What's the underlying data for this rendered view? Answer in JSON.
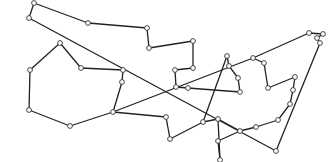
{
  "diagram": {
    "type": "graph-tour",
    "colors": {
      "edge": "#222222",
      "node_fill": "#ffffff",
      "node_stroke": "#333333",
      "background": "#ffffff"
    },
    "node_radius": 2.4,
    "nodes": [
      {
        "id": 0,
        "x": 34,
        "y": 3
      },
      {
        "id": 1,
        "x": 29,
        "y": 18
      },
      {
        "id": 2,
        "x": 88,
        "y": 23
      },
      {
        "id": 3,
        "x": 147,
        "y": 28
      },
      {
        "id": 4,
        "x": 149,
        "y": 48
      },
      {
        "id": 5,
        "x": 193,
        "y": 41
      },
      {
        "id": 6,
        "x": 193,
        "y": 68
      },
      {
        "id": 7,
        "x": 175,
        "y": 70
      },
      {
        "id": 8,
        "x": 176,
        "y": 87
      },
      {
        "id": 9,
        "x": 188,
        "y": 88
      },
      {
        "id": 10,
        "x": 240,
        "y": 92
      },
      {
        "id": 11,
        "x": 238,
        "y": 78
      },
      {
        "id": 12,
        "x": 229,
        "y": 66
      },
      {
        "id": 13,
        "x": 227,
        "y": 56
      },
      {
        "id": 14,
        "x": 253,
        "y": 58
      },
      {
        "id": 15,
        "x": 264,
        "y": 63
      },
      {
        "id": 16,
        "x": 268,
        "y": 88
      },
      {
        "id": 17,
        "x": 295,
        "y": 77
      },
      {
        "id": 18,
        "x": 293,
        "y": 90
      },
      {
        "id": 19,
        "x": 290,
        "y": 104
      },
      {
        "id": 20,
        "x": 278,
        "y": 120
      },
      {
        "id": 21,
        "x": 256,
        "y": 127
      },
      {
        "id": 22,
        "x": 240,
        "y": 131
      },
      {
        "id": 23,
        "x": 218,
        "y": 119
      },
      {
        "id": 24,
        "x": 218,
        "y": 141
      },
      {
        "id": 25,
        "x": 220,
        "y": 160
      },
      {
        "id": 26,
        "x": 203,
        "y": 122
      },
      {
        "id": 27,
        "x": 170,
        "y": 139
      },
      {
        "id": 28,
        "x": 166,
        "y": 117
      },
      {
        "id": 29,
        "x": 113,
        "y": 112
      },
      {
        "id": 30,
        "x": 70,
        "y": 126
      },
      {
        "id": 31,
        "x": 29,
        "y": 110
      },
      {
        "id": 32,
        "x": 30,
        "y": 70
      },
      {
        "id": 33,
        "x": 60,
        "y": 43
      },
      {
        "id": 34,
        "x": 81,
        "y": 68
      },
      {
        "id": 35,
        "x": 123,
        "y": 70
      },
      {
        "id": 36,
        "x": 122,
        "y": 82
      },
      {
        "id": 37,
        "x": 276,
        "y": 151
      },
      {
        "id": 38,
        "x": 309,
        "y": 33
      },
      {
        "id": 39,
        "x": 323,
        "y": 34
      },
      {
        "id": 40,
        "x": 317,
        "y": 38
      },
      {
        "id": 41,
        "x": 320,
        "y": 43
      }
    ],
    "edges": [
      [
        0,
        2
      ],
      [
        2,
        3
      ],
      [
        3,
        4
      ],
      [
        4,
        5
      ],
      [
        5,
        6
      ],
      [
        6,
        7
      ],
      [
        7,
        8
      ],
      [
        8,
        9
      ],
      [
        9,
        10
      ],
      [
        10,
        11
      ],
      [
        11,
        12
      ],
      [
        12,
        13
      ],
      [
        13,
        26
      ],
      [
        14,
        15
      ],
      [
        15,
        16
      ],
      [
        16,
        17
      ],
      [
        17,
        18
      ],
      [
        18,
        19
      ],
      [
        19,
        20
      ],
      [
        20,
        21
      ],
      [
        21,
        22
      ],
      [
        22,
        24
      ],
      [
        24,
        25
      ],
      [
        25,
        23
      ],
      [
        23,
        26
      ],
      [
        26,
        27
      ],
      [
        27,
        28
      ],
      [
        28,
        29
      ],
      [
        29,
        36
      ],
      [
        36,
        35
      ],
      [
        35,
        34
      ],
      [
        34,
        33
      ],
      [
        33,
        32
      ],
      [
        32,
        31
      ],
      [
        31,
        30
      ],
      [
        30,
        29
      ],
      [
        0,
        1
      ],
      [
        1,
        37
      ],
      [
        37,
        41
      ],
      [
        41,
        40
      ],
      [
        40,
        39
      ],
      [
        39,
        38
      ],
      [
        38,
        14
      ],
      [
        14,
        29
      ],
      [
        23,
        22
      ]
    ]
  }
}
